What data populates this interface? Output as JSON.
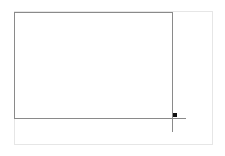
{
  "canvas": {
    "background": "#ffffff",
    "outer_frame_color": "#e6e6e6",
    "selection_border_color": "#8a8a8a",
    "handle_color": "#111111"
  },
  "selection": {
    "handle_icon": "resize-handle-square"
  }
}
